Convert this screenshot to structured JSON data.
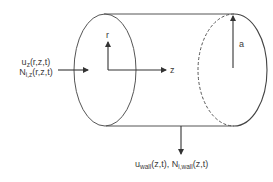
{
  "diagram": {
    "labels": {
      "axis_r": "r",
      "axis_z": "z",
      "radius": "a",
      "inlet_line1_base": "u",
      "inlet_line1_sub": "z",
      "inlet_line1_args": "(r,z,t)",
      "inlet_line2_base": "N",
      "inlet_line2_sub": "i,z",
      "inlet_line2_args": "(r,z,t)",
      "wall_u_base": "u",
      "wall_u_sub": "wall",
      "wall_u_args": "(z,t),",
      "wall_n_base": "N",
      "wall_n_sub": "i,wall",
      "wall_n_args": "(z,t)"
    },
    "colors": {
      "stroke": "#444444",
      "text": "#3a3a3a",
      "background": "#ffffff"
    }
  }
}
